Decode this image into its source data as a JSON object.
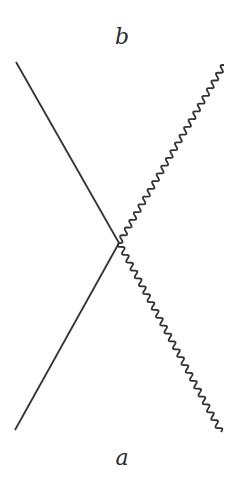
{
  "diagram": {
    "type": "feynman-vertex",
    "labels": {
      "top": "b",
      "bottom": "a"
    },
    "vertex": {
      "x": 119,
      "y": 243
    },
    "lines": [
      {
        "name": "fermion-in",
        "style": "straight",
        "from": {
          "x": 15,
          "y": 430
        },
        "to": {
          "x": 119,
          "y": 243
        }
      },
      {
        "name": "fermion-out",
        "style": "straight",
        "from": {
          "x": 119,
          "y": 243
        },
        "to": {
          "x": 16,
          "y": 62
        }
      },
      {
        "name": "photon-in",
        "style": "wavy",
        "from": {
          "x": 221,
          "y": 432
        },
        "to": {
          "x": 119,
          "y": 243
        }
      },
      {
        "name": "photon-out",
        "style": "wavy",
        "from": {
          "x": 119,
          "y": 243
        },
        "to": {
          "x": 224,
          "y": 65
        }
      }
    ],
    "colors": {
      "stroke": "#333333",
      "background": "#ffffff"
    }
  }
}
